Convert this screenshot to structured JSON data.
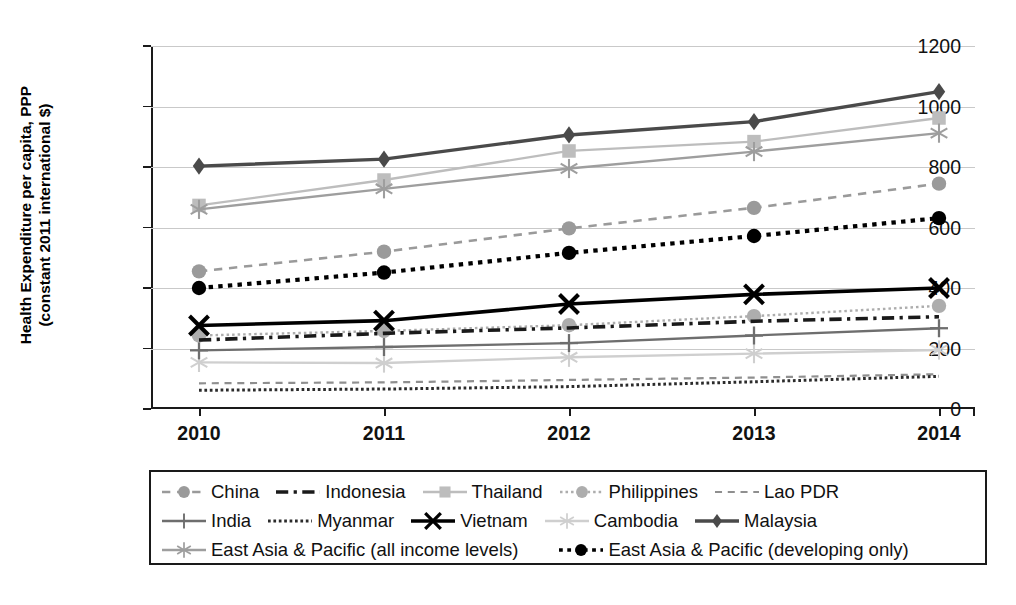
{
  "axes": {
    "ylabel_line1": "Health Expenditure per capita, PPP",
    "ylabel_line2": "(constant 2011 international $)",
    "yticks": [
      "0",
      "200",
      "400",
      "600",
      "800",
      "1000",
      "1200"
    ],
    "xticks": [
      "2010",
      "2011",
      "2012",
      "2013",
      "2014"
    ]
  },
  "legend": {
    "rows": [
      [
        {
          "label": "China",
          "key": "china"
        },
        {
          "label": "Indonesia",
          "key": "indonesia"
        },
        {
          "label": "Thailand",
          "key": "thailand"
        },
        {
          "label": "Philippines",
          "key": "philippines"
        },
        {
          "label": "Lao PDR",
          "key": "lao_pdr"
        }
      ],
      [
        {
          "label": "India",
          "key": "india"
        },
        {
          "label": "Myanmar",
          "key": "myanmar"
        },
        {
          "label": "Vietnam",
          "key": "vietnam"
        },
        {
          "label": "Cambodia",
          "key": "cambodia"
        },
        {
          "label": "Malaysia",
          "key": "malaysia"
        }
      ],
      [
        {
          "label": "East Asia & Pacific (all income levels)",
          "key": "eap_all"
        },
        {
          "label": "East Asia & Pacific (developing only)",
          "key": "eap_dev"
        }
      ]
    ]
  },
  "chart_data": {
    "type": "line",
    "title": "",
    "xlabel": "",
    "ylabel": "Health Expenditure per capita, PPP (constant 2011 international $)",
    "x": [
      2010,
      2011,
      2012,
      2013,
      2014
    ],
    "ylim": [
      0,
      1200
    ],
    "ytick_step": 200,
    "grid": true,
    "legend_position": "bottom",
    "series": [
      {
        "name": "China",
        "key": "china",
        "values": [
          455,
          520,
          597,
          665,
          745
        ],
        "color": "#9a9a9a",
        "marker": "circle",
        "dash": "dashed"
      },
      {
        "name": "Indonesia",
        "key": "indonesia",
        "values": [
          228,
          250,
          268,
          290,
          305
        ],
        "color": "#1a1a1a",
        "marker": "none",
        "dash": "dashdot"
      },
      {
        "name": "Thailand",
        "key": "thailand",
        "values": [
          673,
          757,
          853,
          884,
          962
        ],
        "color": "#bdbdbd",
        "marker": "square",
        "dash": "solid"
      },
      {
        "name": "Philippines",
        "key": "philippines",
        "values": [
          243,
          258,
          277,
          307,
          341
        ],
        "color": "#adadad",
        "marker": "circle",
        "dash": "dotted"
      },
      {
        "name": "Lao PDR",
        "key": "lao_pdr",
        "values": [
          85,
          88,
          96,
          104,
          115
        ],
        "color": "#8f8f8f",
        "marker": "none",
        "dash": "dashed"
      },
      {
        "name": "India",
        "key": "india",
        "values": [
          194,
          205,
          218,
          243,
          267
        ],
        "color": "#6e6e6e",
        "marker": "plus",
        "dash": "solid"
      },
      {
        "name": "Myanmar",
        "key": "myanmar",
        "values": [
          62,
          66,
          74,
          90,
          108
        ],
        "color": "#2b2b2b",
        "marker": "none",
        "dash": "densedot"
      },
      {
        "name": "Vietnam",
        "key": "vietnam",
        "values": [
          276,
          292,
          347,
          379,
          400
        ],
        "color": "#000000",
        "marker": "x",
        "dash": "solid"
      },
      {
        "name": "Cambodia",
        "key": "cambodia",
        "values": [
          154,
          152,
          171,
          183,
          195
        ],
        "color": "#cfcfcf",
        "marker": "asterisk",
        "dash": "solid"
      },
      {
        "name": "Malaysia",
        "key": "malaysia",
        "values": [
          803,
          826,
          906,
          950,
          1049
        ],
        "color": "#4a4a4a",
        "marker": "diamond",
        "dash": "solid"
      },
      {
        "name": "East Asia & Pacific (all income levels)",
        "key": "eap_all",
        "values": [
          660,
          728,
          795,
          851,
          912
        ],
        "color": "#9e9e9e",
        "marker": "asterisk",
        "dash": "solid"
      },
      {
        "name": "East Asia & Pacific (developing only)",
        "key": "eap_dev",
        "values": [
          400,
          451,
          516,
          572,
          631
        ],
        "color": "#000000",
        "marker": "circle-filled",
        "dash": "dotted"
      }
    ]
  }
}
